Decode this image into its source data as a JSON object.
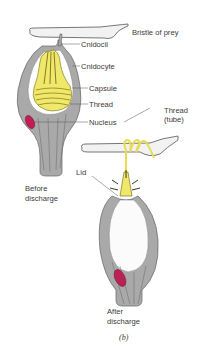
{
  "figure": {
    "panel_label": "(b)",
    "labels": {
      "bristle": "Bristle of prey",
      "cnidocil": "Cnidocil",
      "cnidocyte": "Cnidocyte",
      "capsule": "Capsule",
      "thread": "Thread",
      "nucleus": "Nucleus",
      "thread_tube_1": "Thread",
      "thread_tube_2": "(tube)",
      "lid": "Lid"
    },
    "captions": {
      "before_1": "Before",
      "before_2": "discharge",
      "after_1": "After",
      "after_2": "discharge"
    },
    "colors": {
      "cell_gray": "#a9a9a9",
      "capsule_yellow": "#f0e86a",
      "nucleus_red": "#c21e56",
      "bristle_fill": "#f2f2f2"
    }
  }
}
